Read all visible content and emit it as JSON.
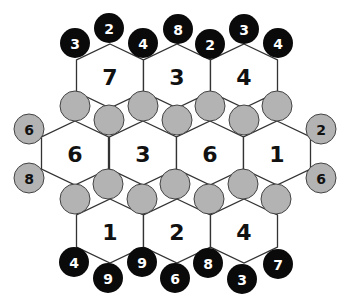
{
  "puzzle": {
    "colors": {
      "hex_fill": "#ffffff",
      "hex_stroke": "#333333",
      "black_token": "#0a0a0a",
      "black_token_text": "#ffffff",
      "gray_token": "#b3b3b3",
      "gray_token_text": "#111111",
      "empty_circle": "#b3b3b3"
    },
    "hexes": [
      {
        "id": "h1",
        "cx": 110,
        "cy": 76,
        "value": "7"
      },
      {
        "id": "h2",
        "cx": 177,
        "cy": 76,
        "value": "3"
      },
      {
        "id": "h3",
        "cx": 244,
        "cy": 76,
        "value": "4"
      },
      {
        "id": "h4",
        "cx": 75,
        "cy": 153,
        "value": "6"
      },
      {
        "id": "h5",
        "cx": 143,
        "cy": 153,
        "value": "3"
      },
      {
        "id": "h6",
        "cx": 210,
        "cy": 153,
        "value": "6"
      },
      {
        "id": "h7",
        "cx": 277,
        "cy": 153,
        "value": "1"
      },
      {
        "id": "h8",
        "cx": 110,
        "cy": 231,
        "value": "1"
      },
      {
        "id": "h9",
        "cx": 177,
        "cy": 231,
        "value": "2"
      },
      {
        "id": "h10",
        "cx": 244,
        "cy": 231,
        "value": "4"
      }
    ],
    "black_tokens": [
      {
        "x": 75,
        "y": 43,
        "value": "3"
      },
      {
        "x": 109,
        "y": 28,
        "value": "2"
      },
      {
        "x": 143,
        "y": 43,
        "value": "4"
      },
      {
        "x": 178,
        "y": 29,
        "value": "8"
      },
      {
        "x": 210,
        "y": 44,
        "value": "2"
      },
      {
        "x": 244,
        "y": 29,
        "value": "3"
      },
      {
        "x": 278,
        "y": 43,
        "value": "4"
      },
      {
        "x": 74,
        "y": 262,
        "value": "4"
      },
      {
        "x": 108,
        "y": 278,
        "value": "9"
      },
      {
        "x": 142,
        "y": 262,
        "value": "9"
      },
      {
        "x": 175,
        "y": 278,
        "value": "6"
      },
      {
        "x": 208,
        "y": 263,
        "value": "8"
      },
      {
        "x": 242,
        "y": 279,
        "value": "3"
      },
      {
        "x": 278,
        "y": 264,
        "value": "7"
      }
    ],
    "gray_tokens": [
      {
        "x": 29,
        "y": 129,
        "value": "6"
      },
      {
        "x": 29,
        "y": 178,
        "value": "8"
      },
      {
        "x": 321,
        "y": 129,
        "value": "2"
      },
      {
        "x": 321,
        "y": 178,
        "value": "6"
      }
    ],
    "empty_circles": [
      {
        "x": 75,
        "y": 106
      },
      {
        "x": 109,
        "y": 120
      },
      {
        "x": 143,
        "y": 106
      },
      {
        "x": 177,
        "y": 120
      },
      {
        "x": 210,
        "y": 106
      },
      {
        "x": 244,
        "y": 120
      },
      {
        "x": 277,
        "y": 106
      },
      {
        "x": 75,
        "y": 199
      },
      {
        "x": 108,
        "y": 184
      },
      {
        "x": 142,
        "y": 199
      },
      {
        "x": 175,
        "y": 184
      },
      {
        "x": 209,
        "y": 199
      },
      {
        "x": 243,
        "y": 184
      },
      {
        "x": 276,
        "y": 199
      }
    ]
  }
}
